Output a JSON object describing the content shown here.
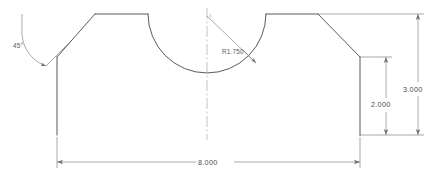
{
  "drawing": {
    "type": "engineering-part-profile",
    "view": "front-orthographic",
    "background_color": "#ffffff",
    "object_line_color": "#3c3c3c",
    "dimension_line_color": "#6e6e6e",
    "centerline_color": "#8c8c8c",
    "text_color": "#4a4a4a",
    "units": "inches",
    "description": "Symmetric plate with 45 degree chamfers on both upper corners and a semicircular notch centered on the top edge"
  },
  "dimensions": [
    {
      "id": "angle-left-chamfer",
      "label": "45°",
      "value": 45,
      "unit": "degrees",
      "kind": "angular",
      "position": {
        "x": 13,
        "y": 48
      }
    },
    {
      "id": "radius-notch",
      "label": "R1.750",
      "value": 1.75,
      "unit": "inches",
      "kind": "radial",
      "position": {
        "x": 222,
        "y": 54
      }
    },
    {
      "id": "height-inner-right",
      "label": "2.000",
      "value": 2.0,
      "unit": "inches",
      "kind": "linear-vertical",
      "position": {
        "x": 381,
        "y": 105
      }
    },
    {
      "id": "height-overall-right",
      "label": "3.000",
      "value": 3.0,
      "unit": "inches",
      "kind": "linear-vertical",
      "position": {
        "x": 413,
        "y": 90
      }
    },
    {
      "id": "width-overall-bottom",
      "label": "8.000",
      "value": 8.0,
      "unit": "inches",
      "kind": "linear-horizontal",
      "position": {
        "x": 208,
        "y": 165
      }
    }
  ],
  "centerline": {
    "id": "vertical-centerline",
    "label": "¢",
    "x": 207,
    "y_top": 8,
    "y_bottom": 140
  },
  "geometry": {
    "outline_points": [
      {
        "x": 57,
        "y": 57,
        "name": "left-edge-top"
      },
      {
        "x": 95,
        "y": 14,
        "name": "left-chamfer-top"
      },
      {
        "x": 148,
        "y": 14,
        "name": "notch-start"
      },
      {
        "x": 266,
        "y": 14,
        "name": "notch-end"
      },
      {
        "x": 318,
        "y": 14,
        "name": "right-chamfer-top"
      },
      {
        "x": 360,
        "y": 57,
        "name": "right-edge-top"
      },
      {
        "x": 360,
        "y": 135,
        "name": "right-edge-bottom"
      },
      {
        "x": 57,
        "y": 135,
        "name": "left-edge-bottom"
      }
    ],
    "arc": {
      "center_x": 207,
      "center_y": 14,
      "radius_px": 59,
      "start_x": 148,
      "end_x": 266,
      "sweep": "downward-semicircle"
    }
  }
}
